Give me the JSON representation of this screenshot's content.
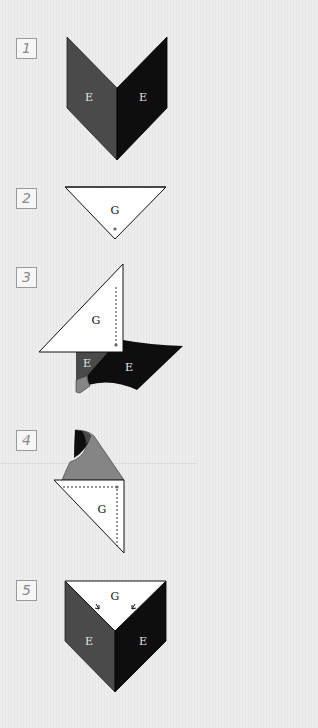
{
  "steps": [
    {
      "number": "1",
      "labels": [
        "E",
        "E"
      ]
    },
    {
      "number": "2",
      "labels": [
        "G"
      ]
    },
    {
      "number": "3",
      "labels": [
        "G",
        "E",
        "E"
      ]
    },
    {
      "number": "4",
      "labels": [
        "G"
      ]
    },
    {
      "number": "5",
      "labels": [
        "G",
        "E",
        "E"
      ]
    }
  ],
  "colors": {
    "dark_gray": "#4a4a4a",
    "black": "#0e0e0e",
    "mid_gray": "#858585",
    "white": "#ffffff",
    "background": "#ececec"
  }
}
